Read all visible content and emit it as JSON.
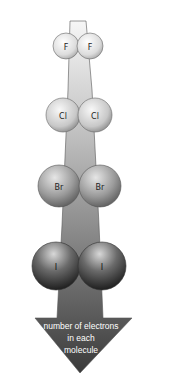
{
  "diagram": {
    "type": "halogen-molecules-electron-trend",
    "molecules": [
      {
        "name": "F2",
        "atoms": [
          {
            "label": "F"
          },
          {
            "label": "F"
          }
        ]
      },
      {
        "name": "Cl2",
        "atoms": [
          {
            "label": "Cl"
          },
          {
            "label": "Cl"
          }
        ]
      },
      {
        "name": "Br2",
        "atoms": [
          {
            "label": "Br"
          },
          {
            "label": "Br"
          }
        ]
      },
      {
        "name": "I2",
        "atoms": [
          {
            "label": "I"
          },
          {
            "label": "I"
          }
        ]
      }
    ],
    "arrow": {
      "lines": [
        "number of electrons",
        "in each",
        "molecule"
      ]
    },
    "colors": {
      "arrow_top": "#f4f4f4",
      "arrow_bottom": "#3c3c3c",
      "atom_light": "#f2f2f2",
      "atom_dark": "#1a1a1a"
    }
  }
}
